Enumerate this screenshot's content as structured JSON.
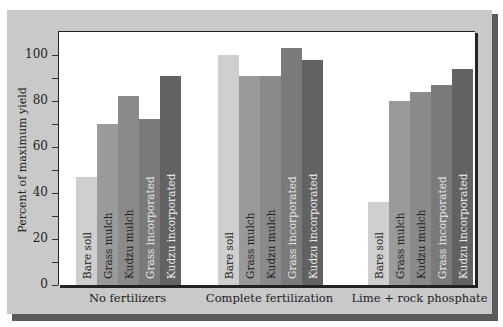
{
  "chart_data": {
    "type": "bar",
    "title": "",
    "xlabel": "",
    "ylabel": "Percent of maximum yield",
    "ylim": [
      0,
      110
    ],
    "yticks": [
      0,
      20,
      40,
      60,
      80,
      100
    ],
    "grid": false,
    "legend": "none (series labels printed inside bars)",
    "categories": [
      "No fertilizers",
      "Complete fertilization",
      "Lime + rock phosphate"
    ],
    "series": [
      {
        "name": "Bare soil",
        "color": "#cfcfcf",
        "label_color": "#222222",
        "values": [
          47,
          100,
          36
        ]
      },
      {
        "name": "Grass mulch",
        "color": "#9a9a9a",
        "label_color": "#222222",
        "values": [
          70,
          91,
          80
        ]
      },
      {
        "name": "Kudzu mulch",
        "color": "#8a8a8a",
        "label_color": "#222222",
        "values": [
          82,
          91,
          84
        ]
      },
      {
        "name": "Grass incorporated",
        "color": "#7a7a7a",
        "label_color": "#e8e8e8",
        "values": [
          72,
          103,
          87
        ]
      },
      {
        "name": "Kudzu incorporated",
        "color": "#626262",
        "label_color": "#eeeeee",
        "values": [
          91,
          98,
          94
        ]
      }
    ]
  },
  "axis": {
    "ylabel": "Percent of maximum yield",
    "ticks": [
      "0",
      "20",
      "40",
      "60",
      "80",
      "100"
    ]
  },
  "groups": [
    "No fertilizers",
    "Complete fertilization",
    "Lime + rock phosphate"
  ]
}
